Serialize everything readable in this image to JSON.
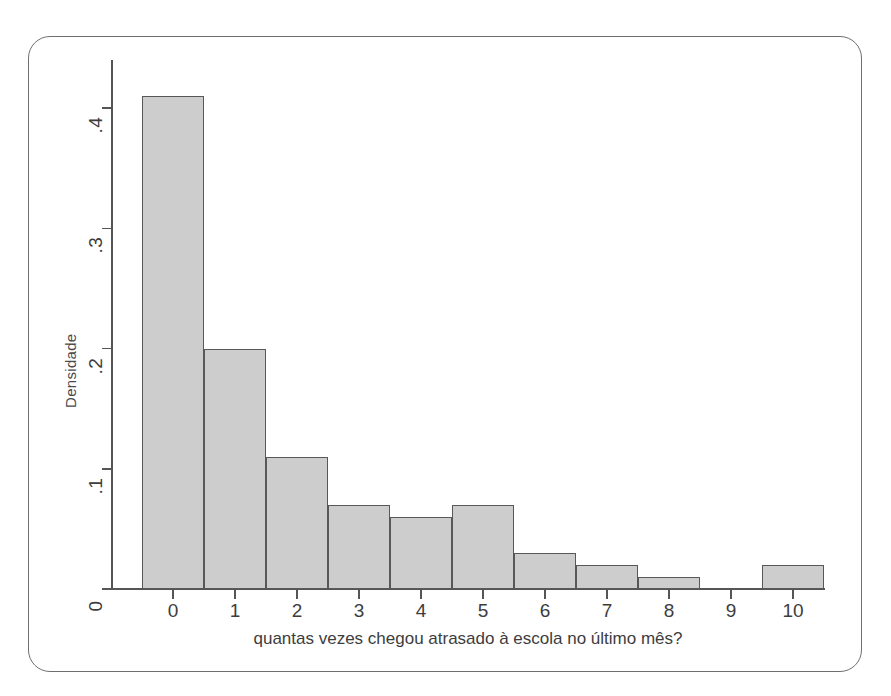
{
  "chart_data": {
    "type": "bar",
    "title": "",
    "subtitle": "",
    "xlabel": "quantas vezes chegou atrasado à escola no último mês?",
    "ylabel": "Densidade",
    "categories": [
      "0",
      "1",
      "2",
      "3",
      "4",
      "5",
      "6",
      "7",
      "8",
      "9",
      "10"
    ],
    "values": [
      0.41,
      0.2,
      0.11,
      0.07,
      0.06,
      0.07,
      0.03,
      0.02,
      0.01,
      0,
      0.02
    ],
    "xtick_labels": [
      "0",
      "1",
      "2",
      "3",
      "4",
      "5",
      "6",
      "7",
      "8",
      "9",
      "10"
    ],
    "ytick_labels": [
      "0",
      ".1",
      ".2",
      ".3",
      ".4"
    ],
    "ytick_values": [
      0,
      0.1,
      0.2,
      0.3,
      0.4
    ],
    "ylim": [
      0,
      0.44
    ],
    "xlim": [
      -0.5,
      10.5
    ],
    "grid": false,
    "legend": false,
    "legend_position": "none",
    "bar_fill_color": "#cdcdcd",
    "bar_edge_color": "#585858",
    "axis_color": "#555555",
    "background_color": "#ffffff",
    "note": "Histograma de densidade; barras contíguas de largura 1 centradas em cada inteiro; sem barra em 9."
  }
}
